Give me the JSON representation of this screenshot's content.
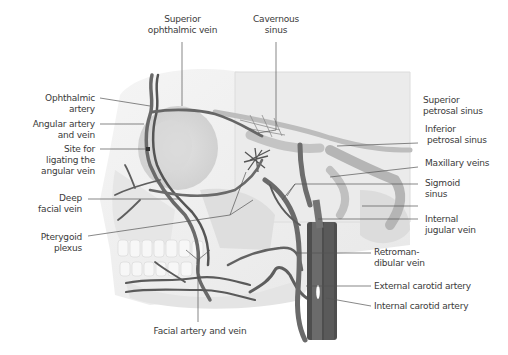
{
  "figure": {
    "colors": {
      "background": "#ffffff",
      "bone": "#ececec",
      "bone_shadow": "#d6d6d6",
      "vessel_dark": "#5a5a5a",
      "vessel_mid": "#7a7a7a",
      "sinus": "#b9b9b9",
      "leader_line": "#555555",
      "label_text": "#3a3a3a"
    }
  },
  "labels": {
    "top": [
      {
        "id": "superior-ophthalmic-vein",
        "lines": [
          "Superior",
          "ophthalmic vein"
        ]
      },
      {
        "id": "cavernous-sinus",
        "lines": [
          "Cavernous",
          "sinus"
        ]
      }
    ],
    "left": [
      {
        "id": "ophthalmic-artery",
        "lines": [
          "Ophthalmic",
          "artery"
        ]
      },
      {
        "id": "angular-artery-and-vein",
        "lines": [
          "Angular artery",
          "and vein"
        ]
      },
      {
        "id": "site-for-ligating",
        "lines": [
          "Site for",
          "ligating the",
          "angular vein"
        ]
      },
      {
        "id": "deep-facial-vein",
        "lines": [
          "Deep",
          "facial vein"
        ]
      },
      {
        "id": "pterygoid-plexus",
        "lines": [
          "Pterygoid",
          "plexus"
        ]
      }
    ],
    "right": [
      {
        "id": "superior-petrosal-sinus",
        "lines": [
          "Superior",
          "petrosal sinus"
        ]
      },
      {
        "id": "inferior-petrosal-sinus",
        "lines": [
          "Inferior",
          "petrosal sinus"
        ]
      },
      {
        "id": "maxillary-veins",
        "lines": [
          "Maxillary veins"
        ]
      },
      {
        "id": "sigmoid-sinus",
        "lines": [
          "Sigmoid",
          "sinus"
        ]
      },
      {
        "id": "internal-jugular-vein",
        "lines": [
          "Internal",
          "jugular vein"
        ]
      },
      {
        "id": "retromandibular-vein",
        "lines": [
          "Retroman-",
          "dibular vein"
        ]
      },
      {
        "id": "external-carotid-artery",
        "lines": [
          "External carotid artery"
        ]
      },
      {
        "id": "internal-carotid-artery",
        "lines": [
          "Internal carotid artery"
        ]
      }
    ],
    "bottom": [
      {
        "id": "facial-artery-and-vein",
        "lines": [
          "Facial artery and vein"
        ]
      }
    ]
  }
}
